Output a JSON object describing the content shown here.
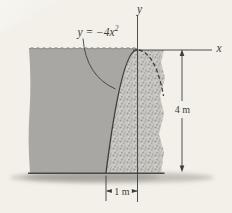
{
  "figure": {
    "equation": {
      "base": "y = −4x",
      "exponent": "2"
    },
    "axes": {
      "y_label": "y",
      "x_label": "x"
    },
    "dimensions": {
      "height_label": "4 m",
      "width_label": "1 m"
    },
    "colors": {
      "background": "#f2f0e9",
      "water": "#a9a7a3",
      "concrete_base": "#c8c6c1",
      "speckle_dark": "#9d9b97",
      "speckle_mid": "#b2b0ac",
      "speckle_light": "#d8d6d2",
      "ink": "#3f3d39",
      "ground": "#4a4844",
      "shadow": "#8a8880",
      "surface_line": "#6b6963"
    }
  }
}
